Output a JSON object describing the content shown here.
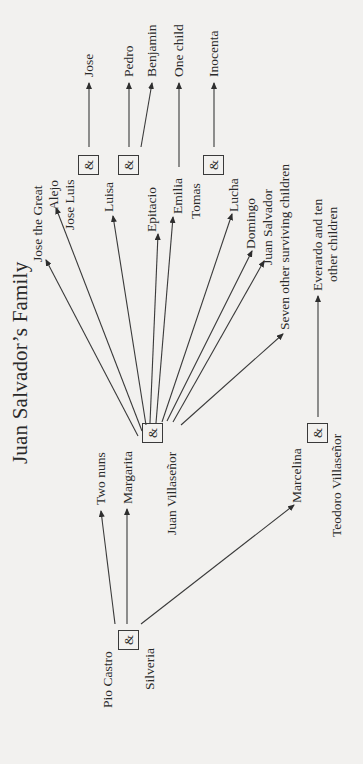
{
  "title": "Juan Salvador’s Family",
  "couple_symbol": "&",
  "people": {
    "pio_castro": "Pio Castro",
    "silveria": "Silveria",
    "two_nuns": "Two nuns",
    "margarita": "Margarita",
    "juan_villasenor": "Juan Villaseñor",
    "marcelina": "Marcelina",
    "teodoro_villasenor": "Teodoro Villaseñor",
    "everardo_line1": "Everardo and ten",
    "everardo_line2": "other children",
    "jose_the_great": "Jose the Great",
    "alejo": "Alejo",
    "jose_luis": "Jose Luis",
    "luisa": "Luisa",
    "epitacio": "Epitacio",
    "emilia": "Emilia",
    "tomas": "Tomas",
    "lucha": "Lucha",
    "domingo": "Domingo",
    "juan_salvador": "Juan Salvador",
    "seven_other": "Seven other surviving children",
    "jose": "Jose",
    "pedro": "Pedro",
    "benjamin": "Benjamin",
    "one_child": "One child",
    "inocenta": "Inocenta"
  },
  "relationships": [
    {
      "couple": [
        "Pio Castro",
        "Silveria"
      ],
      "children": [
        "Two nuns",
        "Margarita",
        "Marcelina"
      ]
    },
    {
      "couple": [
        "Margarita",
        "Juan Villaseñor"
      ],
      "children": [
        "Jose the Great",
        "Alejo",
        "Jose Luis",
        "Luisa",
        "Epitacio",
        "Emilia",
        "Tomas",
        "Lucha",
        "Domingo",
        "Juan Salvador",
        "Seven other surviving children"
      ]
    },
    {
      "couple": [
        "Marcelina",
        "Teodoro Villaseñor"
      ],
      "children": [
        "Everardo and ten other children"
      ]
    },
    {
      "couple": [
        "Jose Luis",
        "Luisa"
      ],
      "children": [
        "Jose"
      ]
    },
    {
      "couple": [
        "Luisa",
        "Epitacio"
      ],
      "children": [
        "Pedro",
        "Benjamin"
      ]
    },
    {
      "couple": [
        "Emilia"
      ],
      "children": [
        "One child"
      ]
    },
    {
      "couple": [
        "Tomas",
        "Lucha"
      ],
      "children": [
        "Inocenta"
      ]
    }
  ]
}
